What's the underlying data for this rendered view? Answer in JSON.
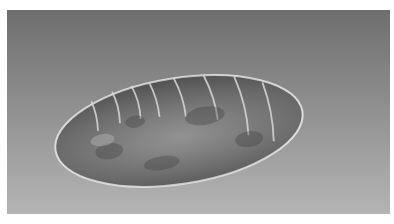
{
  "image": {
    "subject": "insect-pupa",
    "alt": "Grayscale photograph of a segmented oval insect pupa on a gray gradient background",
    "colors": {
      "background_top": "#6e6e6e",
      "background_bottom": "#b4b4b4",
      "body": "#7a7a7a",
      "highlight": "#e6e6e6",
      "frame": "#ffffff"
    }
  }
}
